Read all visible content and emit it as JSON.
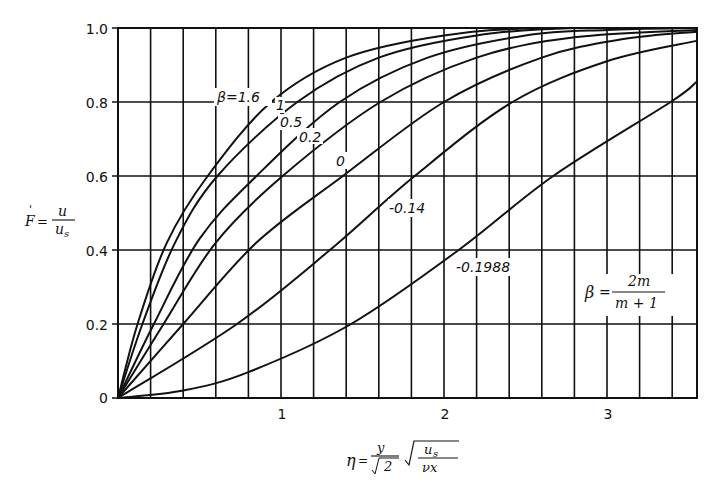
{
  "chart_data": {
    "type": "line",
    "title": "",
    "xlabel": "η = (y/√2) √(u_s/(νx))",
    "ylabel": "F' = u/u_s",
    "xlim": [
      0,
      3.55
    ],
    "ylim": [
      0,
      1.0
    ],
    "grid": true,
    "x_major_ticks": [
      1,
      2,
      3
    ],
    "x_tick_labels": [
      "1",
      "2",
      "3"
    ],
    "x_grid_step": 0.2,
    "y_ticks": [
      0,
      0.2,
      0.4,
      0.6,
      0.8,
      1.0
    ],
    "y_tick_labels": [
      "0",
      "0.2",
      "0.4",
      "0.6",
      "0.8",
      "1.0"
    ],
    "annotation": "β = 2m/(m+1)",
    "series": [
      {
        "name": "β=1.6",
        "label": "β=1.6",
        "x": [
          0,
          0.12,
          0.3,
          0.55,
          0.94,
          1.4,
          2.0,
          2.6,
          3.55
        ],
        "y": [
          0,
          0.2,
          0.42,
          0.6,
          0.8,
          0.92,
          0.98,
          1.0,
          1.0
        ]
      },
      {
        "name": "1",
        "label": "1",
        "x": [
          0,
          0.15,
          0.35,
          0.61,
          1.1,
          1.6,
          2.2,
          2.8,
          3.55
        ],
        "y": [
          0,
          0.2,
          0.42,
          0.6,
          0.8,
          0.92,
          0.98,
          1.0,
          1.0
        ]
      },
      {
        "name": "0.5",
        "label": "0.5",
        "x": [
          0,
          0.22,
          0.5,
          0.85,
          1.36,
          1.9,
          2.5,
          3.0,
          3.55
        ],
        "y": [
          0,
          0.2,
          0.43,
          0.6,
          0.8,
          0.92,
          0.98,
          0.995,
          1.0
        ]
      },
      {
        "name": "0.2",
        "label": "0.2",
        "x": [
          0,
          0.28,
          0.6,
          1.01,
          1.61,
          2.2,
          2.8,
          3.55
        ],
        "y": [
          0,
          0.2,
          0.42,
          0.6,
          0.8,
          0.92,
          0.975,
          0.995
        ]
      },
      {
        "name": "0",
        "label": "0",
        "x": [
          0,
          0.4,
          0.85,
          1.38,
          2.0,
          2.6,
          3.1,
          3.55
        ],
        "y": [
          0,
          0.2,
          0.42,
          0.6,
          0.8,
          0.92,
          0.97,
          0.99
        ]
      },
      {
        "name": "-0.14",
        "label": "-0.14",
        "x": [
          0,
          0.73,
          1.3,
          1.82,
          2.42,
          3.0,
          3.55
        ],
        "y": [
          0,
          0.2,
          0.4,
          0.6,
          0.8,
          0.91,
          0.965
        ]
      },
      {
        "name": "-0.1988",
        "label": "-0.1988",
        "x": [
          0,
          0.4,
          0.8,
          1.43,
          2.09,
          2.67,
          3.39,
          3.55
        ],
        "y": [
          0,
          0.02,
          0.07,
          0.2,
          0.4,
          0.6,
          0.8,
          0.855
        ]
      }
    ]
  },
  "labels": {
    "beta_16": "β=1.6",
    "beta_1": "1",
    "beta_05": "0.5",
    "beta_02": "0.2",
    "beta_0": "0",
    "beta_m014": "-0.14",
    "beta_m01988": "-0.1988",
    "ylabel_lhs": "F",
    "ylabel_prime": "'",
    "ylabel_eq": "=",
    "ylabel_num": "u",
    "ylabel_den": "u",
    "ylabel_den_sub": "s",
    "xlabel_eta": "η",
    "xlabel_eq": "=",
    "xlabel_num": "y",
    "xlabel_den": "2",
    "xlabel_rnum": "u",
    "xlabel_rnum_sub": "s",
    "xlabel_rden": "νx",
    "ann_beta": "β",
    "ann_eq": "=",
    "ann_num": "2m",
    "ann_den": "m + 1"
  }
}
